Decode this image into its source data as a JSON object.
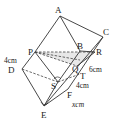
{
  "diagram": {
    "type": "geometry",
    "points": {
      "A": {
        "label": "A",
        "x": 60,
        "y": 16,
        "lx": 55,
        "ly": 13
      },
      "C": {
        "label": "C",
        "x": 103,
        "y": 37,
        "lx": 103,
        "ly": 34
      },
      "B": {
        "label": "B",
        "x": 80,
        "y": 51,
        "lx": 78,
        "ly": 48
      },
      "R": {
        "label": "R",
        "x": 95,
        "y": 52,
        "lx": 96,
        "ly": 54
      },
      "P": {
        "label": "P",
        "x": 35,
        "y": 52,
        "lx": 29,
        "ly": 56
      },
      "D": {
        "label": "D",
        "x": 22,
        "y": 69,
        "lx": 8,
        "ly": 73
      },
      "Q": {
        "label": "Q",
        "x": 77,
        "y": 66,
        "lx": 72,
        "ly": 71
      },
      "T": {
        "label": "T",
        "x": 80,
        "y": 74,
        "lx": 80,
        "ly": 79
      },
      "S": {
        "label": "S",
        "x": 58,
        "y": 82,
        "lx": 51,
        "ly": 88
      },
      "F": {
        "label": "F",
        "x": 68,
        "y": 89,
        "lx": 67,
        "ly": 97
      },
      "E": {
        "label": "E",
        "x": 44,
        "y": 106,
        "lx": 41,
        "ly": 117
      }
    },
    "measurements": [
      {
        "id": "len_4cm_left",
        "text": "4cm",
        "x": 4,
        "y": 63
      },
      {
        "id": "len_6cm",
        "text": "6cm",
        "x": 89,
        "y": 72
      },
      {
        "id": "len_4cm_right",
        "text": "4cm",
        "x": 76,
        "y": 88
      },
      {
        "id": "len_xcm",
        "text": "xcm",
        "x": 72,
        "y": 107
      }
    ]
  }
}
